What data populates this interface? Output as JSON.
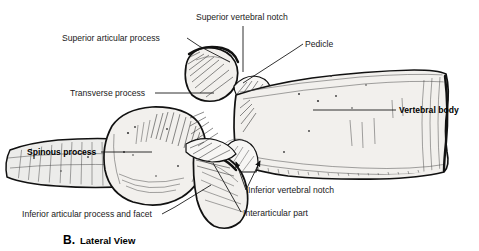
{
  "figure": {
    "title_letter": "B.",
    "title_text": "Lateral View",
    "colors": {
      "ink": "#111111",
      "bone_fill": "#f2f0ed",
      "label_text": "#1a1a1a",
      "background": "#ffffff"
    }
  },
  "labels": [
    {
      "id": "superior-articular-process",
      "text": "Superior articular process",
      "bold": false,
      "x": 62,
      "y": 41,
      "anchor": "start"
    },
    {
      "id": "superior-vertebral-notch",
      "text": "Superior vertebral notch",
      "bold": false,
      "x": 196,
      "y": 20,
      "anchor": "start"
    },
    {
      "id": "pedicle",
      "text": "Pedicle",
      "bold": false,
      "x": 305,
      "y": 47,
      "anchor": "start"
    },
    {
      "id": "transverse-process",
      "text": "Transverse process",
      "bold": false,
      "x": 70,
      "y": 96,
      "anchor": "start"
    },
    {
      "id": "vertebral-body",
      "text": "Vertebral body",
      "bold": true,
      "x": 399,
      "y": 113,
      "anchor": "start"
    },
    {
      "id": "spinous-process",
      "text": "Spinous process",
      "bold": true,
      "x": 27,
      "y": 155,
      "anchor": "start"
    },
    {
      "id": "inferior-vertebral-notch",
      "text": "Inferior vertebral notch",
      "bold": false,
      "x": 248,
      "y": 193,
      "anchor": "start"
    },
    {
      "id": "interarticular-part",
      "text": "Interarticular part",
      "bold": false,
      "x": 243,
      "y": 216,
      "anchor": "start"
    },
    {
      "id": "inferior-articular-process-and-facet",
      "text": "Inferior articular process and facet",
      "bold": false,
      "x": 22,
      "y": 217,
      "anchor": "start"
    }
  ],
  "leaders": [
    {
      "id": "leader-superior-articular-process",
      "d": "M 187 38 L 199 46 L 230 62"
    },
    {
      "id": "leader-superior-vertebral-notch",
      "d": "M 243 26 L 243 72"
    },
    {
      "id": "leader-pedicle",
      "d": "M 303 44 L 294 50 L 243 83"
    },
    {
      "id": "leader-transverse-process",
      "d": "M 155 93 L 214 93"
    },
    {
      "id": "leader-vertebral-body",
      "d": "M 396 110 L 313 110"
    },
    {
      "id": "leader-spinous-process",
      "d": "M 101 152 L 152 152"
    },
    {
      "id": "leader-inferior-vertebral-notch-a",
      "d": "M 246 190 L 236 160",
      "arrow": true
    },
    {
      "id": "leader-inferior-vertebral-notch-b",
      "d": "M 246 190 L 261 159",
      "arrow": true
    },
    {
      "id": "leader-interarticular-part",
      "d": "M 241 212 L 213 163"
    },
    {
      "id": "leader-inferior-articular-process-and-facet",
      "d": "M 162 214 L 175 207 L 211 185"
    }
  ]
}
